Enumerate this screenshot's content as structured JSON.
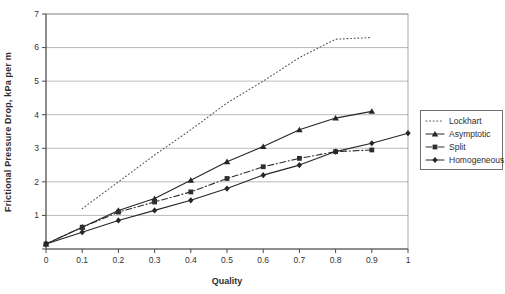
{
  "chart_data": {
    "type": "line",
    "title": "",
    "xlabel": "Quality",
    "ylabel": "Frictional Pressure Drop, kPa per m",
    "xlim": [
      0,
      1
    ],
    "ylim": [
      0,
      7
    ],
    "grid": "horizontal",
    "legend_position": "right",
    "x_tick_labels": [
      "0",
      "0.1",
      "0.2",
      "0.3",
      "0.4",
      "0.5",
      "0.6",
      "0.7",
      "0.8",
      "0.9",
      "1"
    ],
    "y_tick_labels": [
      "1",
      "2",
      "3",
      "4",
      "5",
      "6",
      "7"
    ],
    "x": [
      0,
      0.1,
      0.2,
      0.3,
      0.4,
      0.5,
      0.6,
      0.7,
      0.8,
      0.9,
      1.0
    ],
    "series": [
      {
        "name": "Lockhart",
        "line": "dotted",
        "marker": "none",
        "color": "#555555",
        "values": [
          null,
          1.2,
          2.0,
          2.8,
          3.55,
          4.35,
          5.0,
          5.7,
          6.25,
          6.3,
          null
        ]
      },
      {
        "name": "Asymptotic",
        "line": "solid",
        "marker": "triangle",
        "color": "#262626",
        "values": [
          0.15,
          0.65,
          1.15,
          1.5,
          2.05,
          2.6,
          3.05,
          3.55,
          3.9,
          4.1,
          null
        ]
      },
      {
        "name": "Split",
        "line": "dashdot",
        "marker": "square",
        "color": "#2e2e2e",
        "values": [
          0.15,
          0.65,
          1.1,
          1.4,
          1.7,
          2.1,
          2.45,
          2.7,
          2.9,
          2.95,
          null
        ]
      },
      {
        "name": "Homogeneous",
        "line": "solid",
        "marker": "diamond",
        "color": "#262626",
        "values": [
          0.15,
          0.5,
          0.85,
          1.15,
          1.45,
          1.8,
          2.2,
          2.5,
          2.9,
          3.15,
          3.45
        ]
      }
    ]
  },
  "colors": {
    "grid": "#a8a8a8",
    "plot_border": "#8f8f8f",
    "axis": "#4a4a4a",
    "tick_text": "#333333"
  }
}
